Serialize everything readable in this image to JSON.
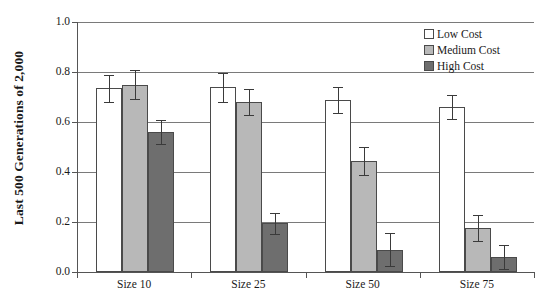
{
  "chart_data": {
    "type": "bar",
    "title": "",
    "xlabel": "",
    "ylabel": "Last 500 Generations of 2,000",
    "categories": [
      "Size 10",
      "Size 25",
      "Size 50",
      "Size 75"
    ],
    "ylim": [
      0.0,
      1.0
    ],
    "ytick_labels": [
      "1.0",
      "0.8",
      "0.6",
      "0.4",
      "0.2",
      "0.0"
    ],
    "ytick_values": [
      1.0,
      0.8,
      0.6,
      0.4,
      0.2,
      0.0
    ],
    "grid": "horizontal",
    "legend_position": "top-right",
    "series": [
      {
        "name": "Low Cost",
        "color": "#ffffff",
        "values": [
          0.735,
          0.74,
          0.69,
          0.66
        ],
        "errors": [
          0.055,
          0.058,
          0.052,
          0.048
        ]
      },
      {
        "name": "Medium Cost",
        "color": "#b8b8b8",
        "values": [
          0.75,
          0.68,
          0.445,
          0.175
        ],
        "errors": [
          0.058,
          0.052,
          0.055,
          0.052
        ]
      },
      {
        "name": "High Cost",
        "color": "#6e6e6e",
        "values": [
          0.56,
          0.195,
          0.09,
          0.06
        ],
        "errors": [
          0.048,
          0.042,
          0.065,
          0.048
        ]
      }
    ]
  },
  "legend": {
    "items": [
      {
        "label": "Low Cost",
        "color": "#ffffff"
      },
      {
        "label": "Medium Cost",
        "color": "#b8b8b8"
      },
      {
        "label": "High Cost",
        "color": "#6e6e6e"
      }
    ]
  }
}
